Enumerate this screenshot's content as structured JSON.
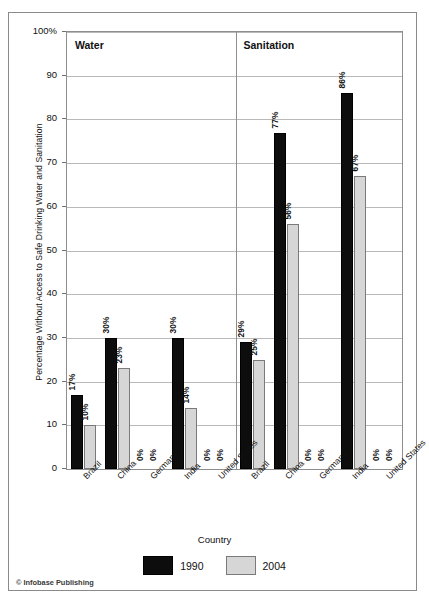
{
  "chart_data": {
    "type": "bar",
    "title": "",
    "xlabel": "Country",
    "ylabel": "Percentage Without Access to Safe Drinking Water and Sanitation",
    "ylim": [
      0,
      100
    ],
    "ytick_labels": [
      "100%",
      "90",
      "80",
      "70",
      "60",
      "50",
      "40",
      "30",
      "20",
      "10",
      "0"
    ],
    "ytick_values": [
      100,
      90,
      80,
      70,
      60,
      50,
      40,
      30,
      20,
      10,
      0
    ],
    "grid": true,
    "legend_position": "bottom-center",
    "categories": [
      "Brazil",
      "China",
      "Germany",
      "India",
      "United States"
    ],
    "panels": [
      {
        "name": "Water",
        "series": [
          {
            "name": "1990",
            "color": "#0d0d0d",
            "values": [
              17,
              30,
              0,
              30,
              0
            ],
            "labels": [
              "17%",
              "30%",
              "0%",
              "30%",
              "0%"
            ]
          },
          {
            "name": "2004",
            "color": "#d6d6d6",
            "values": [
              10,
              23,
              0,
              14,
              0
            ],
            "labels": [
              "10%",
              "23%",
              "0%",
              "14%",
              "0%"
            ]
          }
        ]
      },
      {
        "name": "Sanitation",
        "series": [
          {
            "name": "1990",
            "color": "#0d0d0d",
            "values": [
              29,
              77,
              0,
              86,
              0
            ],
            "labels": [
              "29%",
              "77%",
              "0%",
              "86%",
              "0%"
            ]
          },
          {
            "name": "2004",
            "color": "#d6d6d6",
            "values": [
              25,
              56,
              0,
              67,
              0
            ],
            "labels": [
              "25%",
              "56%",
              "0%",
              "67%",
              "0%"
            ]
          }
        ]
      }
    ],
    "legend": [
      {
        "label": "1990",
        "color": "#0d0d0d"
      },
      {
        "label": "2004",
        "color": "#d6d6d6"
      }
    ]
  },
  "credit": "© Infobase Publishing"
}
